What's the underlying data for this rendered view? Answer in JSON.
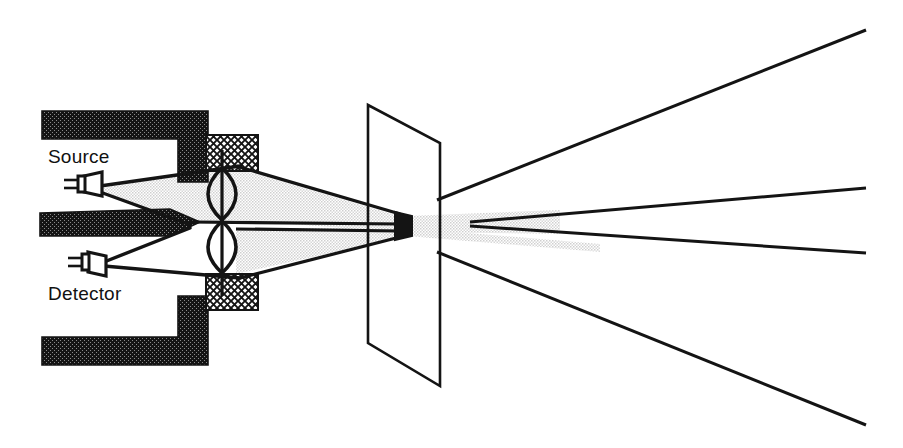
{
  "figure": {
    "background_color": "#ffffff",
    "ink_color": "#111111",
    "beam_fill_color": "#e3e3e3",
    "housing_fill_color": "#1a1a1a",
    "hatch_fill_color": "#ffffff",
    "width": 903,
    "height": 448
  },
  "labels": {
    "source": "Source",
    "detector": "Detector"
  },
  "components": {
    "source_emitter": {
      "name": "source-emitter",
      "x": 72,
      "y": 181,
      "leads": 2
    },
    "detector_receiver": {
      "name": "detector-receiver",
      "x": 76,
      "y": 261,
      "leads": 2
    },
    "upper_lens": {
      "name": "upper-lens",
      "center_x": 222,
      "center_y": 194,
      "half_height": 26,
      "half_width": 16
    },
    "lower_lens": {
      "name": "lower-lens",
      "center_x": 222,
      "center_y": 247,
      "half_height": 26,
      "half_width": 16
    },
    "focal_spot": {
      "name": "focal-spot",
      "x": 403,
      "y": 225
    },
    "target_plane": {
      "name": "target-plane",
      "corners": [
        [
          368,
          105
        ],
        [
          440,
          143
        ],
        [
          440,
          386
        ],
        [
          368,
          343
        ]
      ]
    }
  },
  "rays": {
    "count": 4,
    "right_edge_x": 866,
    "endpoints_y": [
      30,
      188,
      253,
      425
    ]
  }
}
